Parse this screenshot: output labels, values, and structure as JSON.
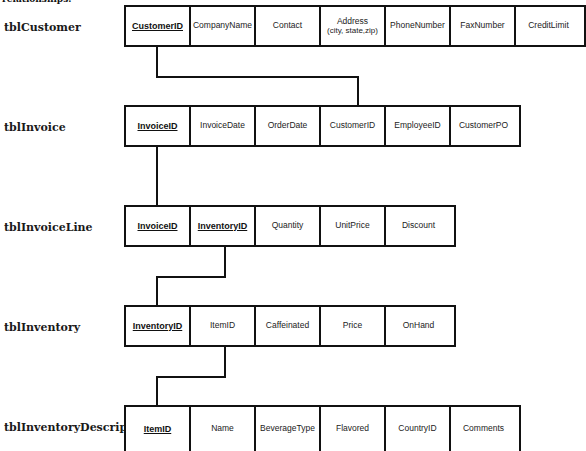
{
  "intro_text": "relationships.",
  "tables": [
    {
      "name": "tblCustomer",
      "fields": [
        {
          "label": "CustomerID",
          "pk": true
        },
        {
          "label": "CompanyName"
        },
        {
          "label": "Contact"
        },
        {
          "label": "Address",
          "sub": "(city, state,zip)"
        },
        {
          "label": "PhoneNumber"
        },
        {
          "label": "FaxNumber"
        },
        {
          "label": "CreditLimit"
        }
      ]
    },
    {
      "name": "tblInvoice",
      "fields": [
        {
          "label": "InvoiceID",
          "pk": true
        },
        {
          "label": "InvoiceDate"
        },
        {
          "label": "OrderDate"
        },
        {
          "label": "CustomerID"
        },
        {
          "label": "EmployeeID"
        },
        {
          "label": "CustomerPO"
        }
      ]
    },
    {
      "name": "tblInvoiceLine",
      "fields": [
        {
          "label": "InvoiceID",
          "pk": true
        },
        {
          "label": "InventoryID",
          "pk": true
        },
        {
          "label": "Quantity"
        },
        {
          "label": "UnitPrice"
        },
        {
          "label": "Discount"
        }
      ]
    },
    {
      "name": "tblInventory",
      "fields": [
        {
          "label": "InventoryID",
          "pk": true
        },
        {
          "label": "ItemID"
        },
        {
          "label": "Caffeinated"
        },
        {
          "label": "Price"
        },
        {
          "label": "OnHand"
        }
      ]
    },
    {
      "name": "tblInventoryDescription",
      "fields": [
        {
          "label": "ItemID",
          "pk": true
        },
        {
          "label": "Name"
        },
        {
          "label": "BeverageType"
        },
        {
          "label": "Flavored"
        },
        {
          "label": "CountryID"
        },
        {
          "label": "Comments"
        }
      ]
    }
  ],
  "relationships": [
    {
      "from": "tblCustomer.CustomerID",
      "to": "tblInvoice.CustomerID"
    },
    {
      "from": "tblInvoice.InvoiceID",
      "to": "tblInvoiceLine.InvoiceID"
    },
    {
      "from": "tblInvoiceLine.InventoryID",
      "to": "tblInventory.InventoryID"
    },
    {
      "from": "tblInventory.ItemID",
      "to": "tblInventoryDescription.ItemID"
    }
  ]
}
